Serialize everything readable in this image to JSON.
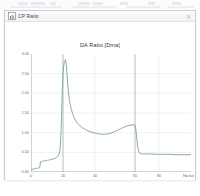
{
  "window": {
    "title": "CP Ratio",
    "icon": "chart-window-icon",
    "close_label": "×",
    "close_icon": "close-icon"
  },
  "backdrop": {
    "ghost_bars": [
      {
        "left": 18,
        "width": 10
      },
      {
        "left": 31,
        "width": 14
      },
      {
        "left": 50,
        "width": 6
      },
      {
        "left": 78,
        "width": 12
      },
      {
        "left": 93,
        "width": 10
      },
      {
        "left": 120,
        "width": 8
      },
      {
        "left": 148,
        "width": 7
      },
      {
        "left": 172,
        "width": 9
      }
    ],
    "ghost_underlines": [
      {
        "left": 10,
        "width": 52
      },
      {
        "left": 72,
        "width": 44
      },
      {
        "left": 126,
        "width": 34
      },
      {
        "left": 168,
        "width": 26
      }
    ]
  },
  "chart_data": {
    "type": "line",
    "title": "DA Ratio [Dma]",
    "xlabel": "",
    "ylabel": "",
    "x_unit": "No kw",
    "grid": true,
    "legend": null,
    "line_color": "#7aa77f",
    "line_width": 0.9,
    "xlim": [
      0,
      100
    ],
    "ylim": [
      0,
      3.0
    ],
    "yticks": [
      3.0,
      2.5,
      2.0,
      1.5,
      1.0,
      0.5,
      0.0
    ],
    "ytick_labels": [
      "3.00",
      "2.50",
      "2.00",
      "1.50",
      "1.00",
      "0.50",
      "0.00"
    ],
    "xticks": [
      0,
      20,
      40,
      65,
      80
    ],
    "xtick_labels": [
      "0",
      "20",
      "40",
      "65",
      "80"
    ],
    "gridlines_x": [
      20,
      40,
      65,
      80
    ],
    "gridlines_y": [
      0.5,
      1.0,
      1.5,
      2.0,
      2.5
    ],
    "cursors_x": [
      20,
      65
    ],
    "cursor_color": "#b9bcc4",
    "series": [
      {
        "name": "DA Ratio",
        "x": [
          0.0,
          0.6,
          1.2,
          1.8,
          2.4,
          3.0,
          3.6,
          4.2,
          4.8,
          5.4,
          6.0,
          6.6,
          7.2,
          7.8,
          8.4,
          9.0,
          9.6,
          10.2,
          10.8,
          11.4,
          12.0,
          12.6,
          13.2,
          13.8,
          14.4,
          15.0,
          15.6,
          16.2,
          16.8,
          17.4,
          18.0,
          18.4,
          18.8,
          19.2,
          19.6,
          20.0,
          20.4,
          20.8,
          21.2,
          21.6,
          22.0,
          22.6,
          23.2,
          24.0,
          25.0,
          26.0,
          27.0,
          28.0,
          29.0,
          30.0,
          32.0,
          34.0,
          36.0,
          38.0,
          40.0,
          42.0,
          44.0,
          46.0,
          48.0,
          50.0,
          52.0,
          54.0,
          56.0,
          58.0,
          60.0,
          62.0,
          63.5,
          64.5,
          65.0,
          65.6,
          66.2,
          66.8,
          67.4,
          68.0,
          69.0,
          70.0,
          72.0,
          75.0,
          78.0,
          81.0,
          84.0,
          87.0,
          90.0,
          93.0,
          96.0,
          100.0
        ],
        "y": [
          0.06,
          0.07,
          0.07,
          0.08,
          0.08,
          0.09,
          0.09,
          0.1,
          0.1,
          0.11,
          0.26,
          0.27,
          0.27,
          0.28,
          0.28,
          0.29,
          0.29,
          0.3,
          0.3,
          0.31,
          0.31,
          0.32,
          0.32,
          0.33,
          0.34,
          0.35,
          0.36,
          0.38,
          0.4,
          0.44,
          0.52,
          0.7,
          1.05,
          1.55,
          2.1,
          2.52,
          2.7,
          2.78,
          2.82,
          2.86,
          2.74,
          2.42,
          2.1,
          1.82,
          1.62,
          1.48,
          1.38,
          1.3,
          1.24,
          1.2,
          1.13,
          1.08,
          1.04,
          1.01,
          0.99,
          0.97,
          0.96,
          0.96,
          0.97,
          0.99,
          1.02,
          1.06,
          1.1,
          1.14,
          1.17,
          1.19,
          1.2,
          1.2,
          1.19,
          1.06,
          0.82,
          0.62,
          0.52,
          0.48,
          0.46,
          0.46,
          0.46,
          0.46,
          0.45,
          0.45,
          0.45,
          0.45,
          0.44,
          0.44,
          0.44,
          0.44
        ]
      }
    ]
  }
}
